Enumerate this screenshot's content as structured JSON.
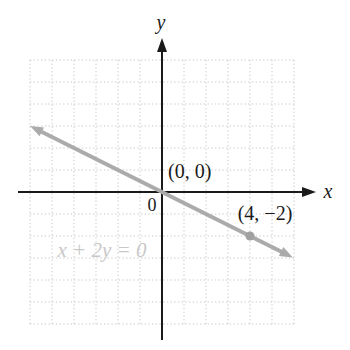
{
  "chart_data": {
    "type": "line",
    "title": "",
    "equation_label": "x + 2y = 0",
    "axis_labels": {
      "x": "x",
      "y": "y"
    },
    "origin_label": "0",
    "x_range": [
      -6,
      6
    ],
    "y_range": [
      -6,
      6
    ],
    "grid": true,
    "legend": false,
    "line": {
      "slope": -0.5,
      "intercept": 0,
      "extent_x": [
        -5.75,
        5.7
      ]
    },
    "points": [
      {
        "x": 0,
        "y": 0,
        "label": "(0, 0)",
        "marked": false
      },
      {
        "x": 4,
        "y": -2,
        "label": "(4, −2)",
        "marked": true
      }
    ],
    "colors": {
      "axis": "#1a1a1a",
      "line": "#ababab",
      "point": "#a0a0a0",
      "grid": "#c7c7c7",
      "equation_text": "#c8c8c8",
      "label_text": "#1a1a1a"
    }
  }
}
